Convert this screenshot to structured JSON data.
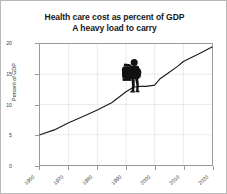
{
  "chart_data": {
    "type": "line",
    "title": "Health care cost as percent of GDP",
    "subtitle": "A heavy load to carry",
    "xlabel": "",
    "ylabel": "Percent of GDP",
    "xlim": [
      1960,
      2020
    ],
    "ylim": [
      0,
      20
    ],
    "grid": true,
    "legend": null,
    "x_ticks": [
      "1960",
      "1970",
      "1980",
      "1990",
      "2000",
      "2010",
      "2020"
    ],
    "x_tick_values": [
      1960,
      1970,
      1980,
      1990,
      2000,
      2010,
      2020
    ],
    "y_ticks": [
      "0",
      "5",
      "10",
      "15",
      "20"
    ],
    "y_tick_values": [
      0,
      5,
      10,
      15,
      20
    ],
    "line_color": "#1c1c1c",
    "grid_color": "#e2e2e2",
    "axis_color": "#9a9a9a",
    "series": [
      {
        "name": "Health care cost as percent of GDP",
        "x": [
          1960,
          1965,
          1970,
          1975,
          1980,
          1985,
          1990,
          1992,
          1993,
          1995,
          1997,
          2000,
          2002,
          2005,
          2008,
          2010,
          2013,
          2016,
          2020
        ],
        "values": [
          5.0,
          5.8,
          7.0,
          8.0,
          9.1,
          10.3,
          12.1,
          12.7,
          12.9,
          13.0,
          13.0,
          13.2,
          14.3,
          15.3,
          16.3,
          17.1,
          17.8,
          18.5,
          19.5
        ]
      }
    ],
    "annotations": [
      {
        "name": "hiker-with-backpack",
        "icon": "hiker-icon",
        "x": 1992,
        "y": 12.7,
        "color": "#111111",
        "description": "Black silhouette of a hiker carrying a heavy backpack, standing on the rising cost line"
      }
    ]
  }
}
